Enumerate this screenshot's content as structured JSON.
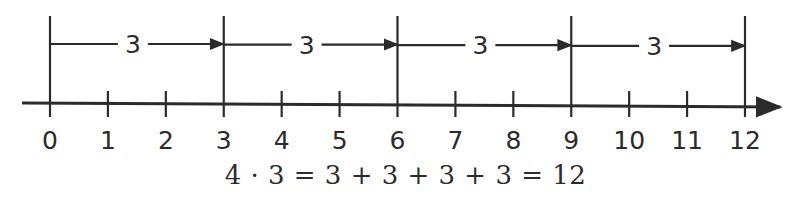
{
  "diagram": {
    "type": "number-line-repeated-addition",
    "axis": {
      "min": 0,
      "max": 12,
      "ticks": [
        0,
        1,
        2,
        3,
        4,
        5,
        6,
        7,
        8,
        9,
        10,
        11,
        12
      ],
      "tick_labels": [
        "0",
        "1",
        "2",
        "3",
        "4",
        "5",
        "6",
        "7",
        "8",
        "9",
        "10",
        "11",
        "12"
      ],
      "arrow_direction": "right"
    },
    "jumps": [
      {
        "from": 0,
        "to": 3,
        "label": "3"
      },
      {
        "from": 3,
        "to": 6,
        "label": "3"
      },
      {
        "from": 6,
        "to": 9,
        "label": "3"
      },
      {
        "from": 9,
        "to": 12,
        "label": "3"
      }
    ],
    "equation": "4 · 3 = 3 + 3 + 3 + 3 = 12",
    "colors": {
      "ink": "#2b2b2b",
      "background": "#ffffff"
    }
  }
}
